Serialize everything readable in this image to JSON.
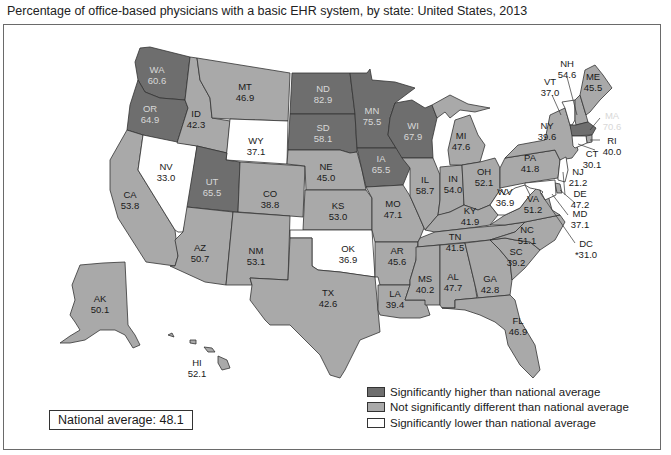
{
  "title": "Percentage of office-based physicians with a basic EHR system, by state: United States, 2013",
  "national_average_label": "National average: 48.1",
  "colors": {
    "higher": "#6e6e6e",
    "not_different": "#a9a9a9",
    "lower": "#ffffff",
    "border": "#333333"
  },
  "legend": [
    {
      "category": "higher",
      "label": "Significantly higher than national average"
    },
    {
      "category": "not_different",
      "label": "Not significantly different than national average"
    },
    {
      "category": "lower",
      "label": "Significantly lower than national average"
    }
  ],
  "states": {
    "WA": {
      "abbr": "WA",
      "value": "60.6",
      "category": "higher"
    },
    "OR": {
      "abbr": "OR",
      "value": "64.9",
      "category": "higher"
    },
    "CA": {
      "abbr": "CA",
      "value": "53.8",
      "category": "not_different"
    },
    "NV": {
      "abbr": "NV",
      "value": "33.0",
      "category": "lower"
    },
    "ID": {
      "abbr": "ID",
      "value": "42.3",
      "category": "not_different"
    },
    "MT": {
      "abbr": "MT",
      "value": "46.9",
      "category": "not_different"
    },
    "WY": {
      "abbr": "WY",
      "value": "37.1",
      "category": "lower"
    },
    "UT": {
      "abbr": "UT",
      "value": "65.5",
      "category": "higher"
    },
    "CO": {
      "abbr": "CO",
      "value": "38.8",
      "category": "not_different"
    },
    "AZ": {
      "abbr": "AZ",
      "value": "50.7",
      "category": "not_different"
    },
    "NM": {
      "abbr": "NM",
      "value": "53.1",
      "category": "not_different"
    },
    "ND": {
      "abbr": "ND",
      "value": "82.9",
      "category": "higher"
    },
    "SD": {
      "abbr": "SD",
      "value": "58.1",
      "category": "higher"
    },
    "NE": {
      "abbr": "NE",
      "value": "45.0",
      "category": "not_different"
    },
    "KS": {
      "abbr": "KS",
      "value": "53.0",
      "category": "not_different"
    },
    "OK": {
      "abbr": "OK",
      "value": "36.9",
      "category": "lower"
    },
    "TX": {
      "abbr": "TX",
      "value": "42.6",
      "category": "not_different"
    },
    "MN": {
      "abbr": "MN",
      "value": "75.5",
      "category": "higher"
    },
    "IA": {
      "abbr": "IA",
      "value": "65.5",
      "category": "higher"
    },
    "MO": {
      "abbr": "MO",
      "value": "47.1",
      "category": "not_different"
    },
    "AR": {
      "abbr": "AR",
      "value": "45.6",
      "category": "not_different"
    },
    "LA": {
      "abbr": "LA",
      "value": "39.4",
      "category": "not_different"
    },
    "WI": {
      "abbr": "WI",
      "value": "67.9",
      "category": "higher"
    },
    "IL": {
      "abbr": "IL",
      "value": "58.7",
      "category": "not_different"
    },
    "MI": {
      "abbr": "MI",
      "value": "47.6",
      "category": "not_different"
    },
    "IN": {
      "abbr": "IN",
      "value": "54.0",
      "category": "not_different"
    },
    "OH": {
      "abbr": "OH",
      "value": "52.1",
      "category": "not_different"
    },
    "KY": {
      "abbr": "KY",
      "value": "41.9",
      "category": "not_different"
    },
    "TN": {
      "abbr": "TN",
      "value": "41.5",
      "category": "not_different"
    },
    "MS": {
      "abbr": "MS",
      "value": "40.2",
      "category": "not_different"
    },
    "AL": {
      "abbr": "AL",
      "value": "47.7",
      "category": "not_different"
    },
    "GA": {
      "abbr": "GA",
      "value": "42.8",
      "category": "not_different"
    },
    "FL": {
      "abbr": "FL",
      "value": "46.9",
      "category": "not_different"
    },
    "SC": {
      "abbr": "SC",
      "value": "39.2",
      "category": "not_different"
    },
    "NC": {
      "abbr": "NC",
      "value": "51.1",
      "category": "not_different"
    },
    "VA": {
      "abbr": "VA",
      "value": "51.2",
      "category": "not_different"
    },
    "WV": {
      "abbr": "WV",
      "value": "36.9",
      "category": "lower"
    },
    "PA": {
      "abbr": "PA",
      "value": "41.8",
      "category": "not_different"
    },
    "NY": {
      "abbr": "NY",
      "value": "39.6",
      "category": "not_different"
    },
    "VT": {
      "abbr": "VT",
      "value": "37.0",
      "category": "lower"
    },
    "NH": {
      "abbr": "NH",
      "value": "54.6",
      "category": "not_different"
    },
    "ME": {
      "abbr": "ME",
      "value": "45.5",
      "category": "not_different"
    },
    "MA": {
      "abbr": "MA",
      "value": "70.6",
      "category": "higher"
    },
    "RI": {
      "abbr": "RI",
      "value": "40.0",
      "category": "not_different"
    },
    "CT": {
      "abbr": "CT",
      "value": "30.1",
      "category": "lower"
    },
    "NJ": {
      "abbr": "NJ",
      "value": "21.2",
      "category": "lower"
    },
    "DE": {
      "abbr": "DE",
      "value": "47.2",
      "category": "not_different"
    },
    "MD": {
      "abbr": "MD",
      "value": "37.1",
      "category": "lower"
    },
    "DC": {
      "abbr": "DC",
      "value": "*31.0",
      "category": "lower"
    },
    "AK": {
      "abbr": "AK",
      "value": "50.1",
      "category": "not_different"
    },
    "HI": {
      "abbr": "HI",
      "value": "52.1",
      "category": "not_different"
    }
  }
}
